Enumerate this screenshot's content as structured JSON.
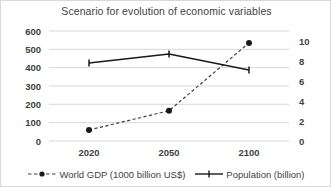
{
  "chart_data": {
    "type": "line",
    "title": "Scenario for evolution of economic variables",
    "xlabel": "",
    "ylabel": "",
    "categories": [
      "2020",
      "2050",
      "2100"
    ],
    "grid": true,
    "legend_position": "bottom",
    "axes": {
      "left": {
        "label": "",
        "ylim": [
          0,
          600
        ],
        "ticks": [
          600,
          500,
          400,
          300,
          200,
          100,
          0
        ],
        "tick_labels": [
          "600",
          "500",
          "400",
          "300",
          "200",
          "100",
          "0"
        ]
      },
      "right": {
        "label": "",
        "ylim": [
          0,
          11
        ],
        "ticks": [
          10,
          8,
          6,
          4,
          2,
          0
        ],
        "tick_labels": [
          "10",
          "8",
          "6",
          "4",
          "2",
          "0"
        ]
      }
    },
    "series": [
      {
        "name": "World GDP (1000 billion US$)",
        "axis": "left",
        "values": [
          60,
          165,
          535
        ],
        "line_style": "dashed",
        "marker": "circle",
        "color": "#404040"
      },
      {
        "name": "Population (billion)",
        "axis": "right",
        "values": [
          7.8,
          8.7,
          7.1
        ],
        "line_style": "solid",
        "marker": "tick",
        "color": "#1a1a1a"
      }
    ]
  },
  "legend": {
    "items": [
      {
        "label": "World GDP (1000 billion US$)",
        "marker_name": "dashed-line-circle-marker"
      },
      {
        "label": "Population (billion)",
        "marker_name": "solid-line-tick-marker"
      }
    ]
  },
  "colors": {
    "gdp_line": "#404040",
    "population_line": "#1a1a1a",
    "gridline": "#d4d4d4",
    "text": "#3f3f3f",
    "background": "#ffffff",
    "border": "#d9d9d9"
  }
}
